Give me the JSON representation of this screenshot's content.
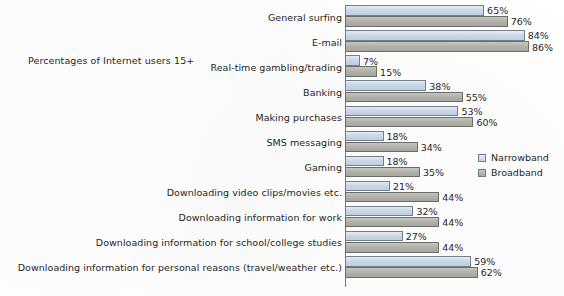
{
  "caption": "Percentages of Internet users 15+",
  "legend": {
    "items": [
      {
        "label": "Narrowband",
        "icon": "square-swatch-icon",
        "color": "#ccdbea"
      },
      {
        "label": "Broadband",
        "icon": "square-swatch-icon",
        "color": "#b3b3ad"
      }
    ]
  },
  "chart_data": {
    "type": "bar",
    "orientation": "horizontal",
    "title": "",
    "subtitle": "Percentages of Internet users 15+",
    "xlabel": "",
    "ylabel": "",
    "xlim": [
      0,
      100
    ],
    "grid": false,
    "legend_position": "right",
    "value_suffix": "%",
    "categories": [
      "General surfing",
      "E-mail",
      "Real-time gambling/trading",
      "Banking",
      "Making purchases",
      "SMS messaging",
      "Gaming",
      "Downloading video clips/movies etc.",
      "Downloading information for work",
      "Downloading information for school/college studies",
      "Downloading information for personal reasons (travel/weather etc.)"
    ],
    "series": [
      {
        "name": "Narrowband",
        "color": "#ccdbea",
        "values": [
          65,
          84,
          7,
          38,
          53,
          18,
          18,
          21,
          32,
          27,
          59
        ],
        "labels": [
          "65%",
          "84%",
          "7%",
          "38%",
          "53%",
          "18%",
          "18%",
          "21%",
          "32%",
          "27%",
          "59%"
        ]
      },
      {
        "name": "Broadband",
        "color": "#b3b3ad",
        "values": [
          76,
          86,
          15,
          55,
          60,
          34,
          35,
          44,
          44,
          44,
          62
        ],
        "labels": [
          "76%",
          "86%",
          "15%",
          "55%",
          "60%",
          "34%",
          "35%",
          "44%",
          "44%",
          "44%",
          "62%"
        ]
      }
    ]
  }
}
